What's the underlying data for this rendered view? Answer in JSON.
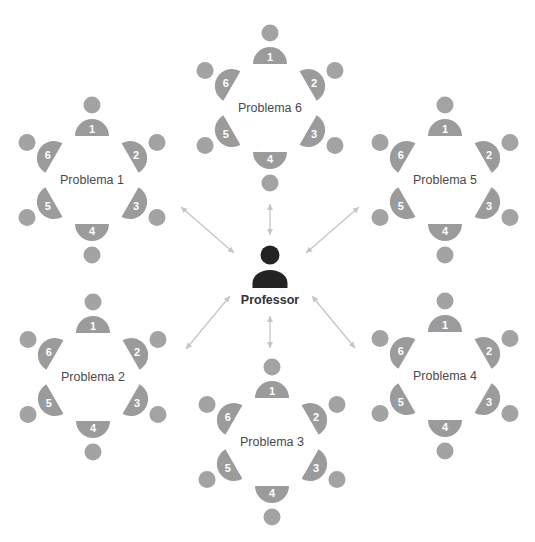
{
  "diagram": {
    "colors": {
      "seat": "#9b9b9b",
      "student": "#a3a3a3",
      "professor": "#232323",
      "arrow": "#c6c6c6",
      "label": "#4a4a4a"
    },
    "professor": {
      "label": "Professor",
      "x": 270,
      "y": 262
    },
    "seat_numbers": [
      "1",
      "2",
      "3",
      "4",
      "5",
      "6"
    ],
    "tables": [
      {
        "id": "t1",
        "label": "Problema 1",
        "cx": 92,
        "cy": 180
      },
      {
        "id": "t2",
        "label": "Problema 2",
        "cx": 93,
        "cy": 377
      },
      {
        "id": "t3",
        "label": "Problema 3",
        "cx": 272,
        "cy": 442
      },
      {
        "id": "t4",
        "label": "Problema 4",
        "cx": 445,
        "cy": 376
      },
      {
        "id": "t5",
        "label": "Problema 5",
        "cx": 445,
        "cy": 180
      },
      {
        "id": "t6",
        "label": "Problema 6",
        "cx": 270,
        "cy": 108
      }
    ],
    "arrows": [
      {
        "to": "Problema 6",
        "x1": 270,
        "y1": 204,
        "x2": 270,
        "y2": 235
      },
      {
        "to": "Problema 1",
        "x1": 181,
        "y1": 207,
        "x2": 234,
        "y2": 253
      },
      {
        "to": "Problema 5",
        "x1": 359,
        "y1": 207,
        "x2": 306,
        "y2": 253
      },
      {
        "to": "Problema 2",
        "x1": 230,
        "y1": 296,
        "x2": 186,
        "y2": 349
      },
      {
        "to": "Problema 4",
        "x1": 312,
        "y1": 296,
        "x2": 355,
        "y2": 348
      },
      {
        "to": "Problema 3",
        "x1": 270,
        "y1": 316,
        "x2": 270,
        "y2": 348
      }
    ]
  }
}
